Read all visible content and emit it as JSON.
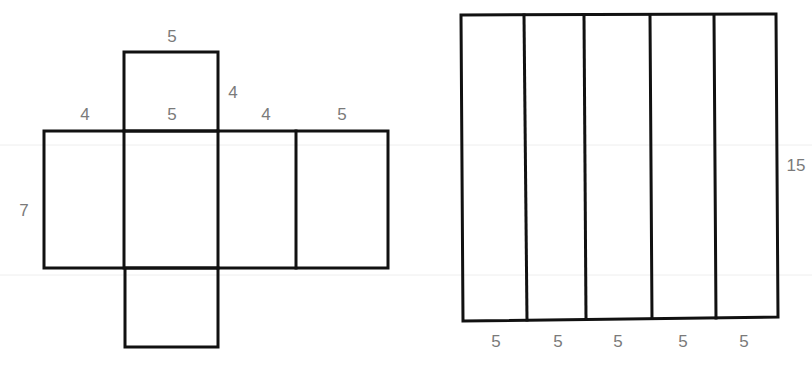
{
  "colors": {
    "line": "#111111",
    "label": "#7a7a7a",
    "background": "#ffffff"
  },
  "net": {
    "description": "Net of a rectangular prism 5 x 4 x 7",
    "labels": {
      "top_flap_width": "5",
      "top_flap_height": "4",
      "row_face1_width": "4",
      "row_face2_width": "5",
      "row_face3_width": "4",
      "row_face4_width": "5",
      "row_height": "7"
    }
  },
  "lateral": {
    "description": "Lateral surface of a prism unfolded into 5 strips",
    "labels": {
      "height": "15",
      "strip_widths": [
        "5",
        "5",
        "5",
        "5",
        "5"
      ]
    }
  }
}
